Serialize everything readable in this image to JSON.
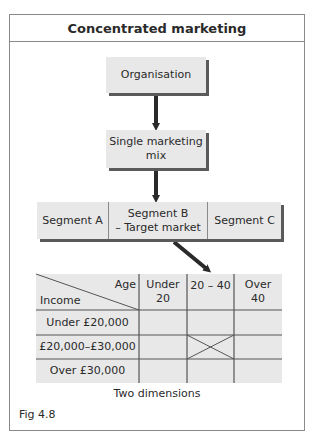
{
  "title": "Concentrated marketing",
  "flow": {
    "organisation": "Organisation",
    "mix": "Single marketing mix",
    "mix_line1": "Single marketing",
    "mix_line2": "mix"
  },
  "segments": [
    {
      "label": "Segment A",
      "line2": ""
    },
    {
      "label": "Segment B",
      "line2": "– Target market"
    },
    {
      "label": "Segment C",
      "line2": ""
    }
  ],
  "table": {
    "corner_top": "Age",
    "corner_bottom": "Income",
    "columns": [
      {
        "line1": "Under",
        "line2": "20"
      },
      {
        "line1": "20 – 40",
        "line2": ""
      },
      {
        "line1": "Over",
        "line2": "40"
      }
    ],
    "rows": [
      "Under £20,000",
      "£20,000–£30,000",
      "Over £30,000"
    ],
    "target_cell": {
      "row": 1,
      "column": 1,
      "marker": "X"
    }
  },
  "caption": "Two dimensions",
  "figure_label": "Fig 4.8",
  "colors": {
    "box_fill": "#e8e8e8",
    "shadow": "#5a5a5a",
    "line": "#8a8a8a",
    "arrow": "#2a2a2a"
  }
}
